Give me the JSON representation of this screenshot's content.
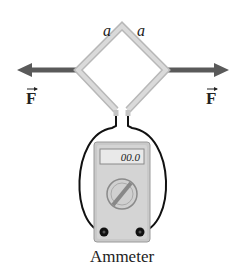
{
  "diagram": {
    "side_label_left": "a",
    "side_label_right": "a",
    "force_label_left": "F",
    "force_label_right": "F",
    "meter_reading": "00.0",
    "meter_label": "Ammeter",
    "colors": {
      "loop": "#cfcfcf",
      "loop_edge": "#b8b8b8",
      "arrow": "#5a5a5a",
      "wire": "#111111",
      "meter_body": "#c9c9c9",
      "meter_inner": "#dcdcdc",
      "display": "#e6e6e6"
    }
  }
}
